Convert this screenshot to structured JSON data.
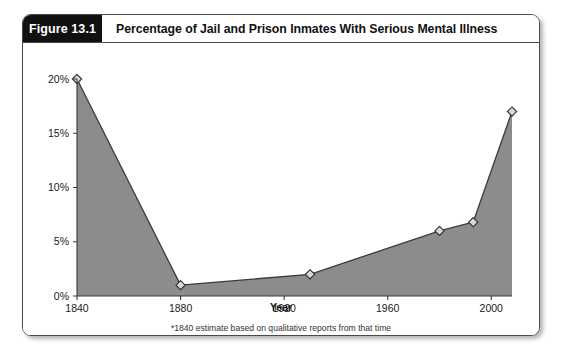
{
  "figure": {
    "number_label": "Figure 13.1",
    "title": "Percentage of Jail and Prison Inmates With Serious Mental Illness"
  },
  "footnote": "*1840 estimate based on qualitative reports from that time",
  "colors": {
    "header_box_background": "#111111",
    "header_box_text": "#ffffff",
    "area_fill": "#8c8c8c",
    "line_stroke": "#3b3b3b",
    "marker_fill": "#d9d9d9",
    "marker_stroke": "#2e2e2e",
    "frame_border": "#4a4a4a"
  },
  "chart_data": {
    "type": "area",
    "title": "Percentage of Jail and Prison Inmates With Serious Mental Illness",
    "subtitle": "",
    "xlabel": "Year",
    "ylabel": "",
    "x": [
      1840,
      1880,
      1930,
      1980,
      1993,
      2008
    ],
    "values": [
      20,
      1,
      2,
      6,
      6.8,
      17
    ],
    "point_labels": [
      "20%",
      "1%",
      "2%",
      "6%",
      "6.8%",
      "17%"
    ],
    "xlim": [
      1840,
      2008
    ],
    "ylim": [
      0,
      20
    ],
    "xticks": [
      1840,
      1880,
      1920,
      1960,
      2000
    ],
    "xtick_labels": [
      "1840",
      "1880",
      "1920",
      "1960",
      "2000"
    ],
    "yticks": [
      0,
      5,
      10,
      15,
      20
    ],
    "ytick_labels": [
      "0%",
      "5%",
      "10%",
      "15%",
      "20%"
    ],
    "grid": false,
    "legend": false,
    "legend_position": "none",
    "marker_style": "diamond",
    "annotations": [
      "*1840 estimate based on qualitative reports from that time"
    ]
  },
  "axis": {
    "y_labels": [
      "20%",
      "15%",
      "10%",
      "5%",
      "0%"
    ],
    "x_labels": [
      "1840",
      "1880",
      "1920",
      "1960",
      "2000"
    ],
    "x_title": "Year"
  }
}
